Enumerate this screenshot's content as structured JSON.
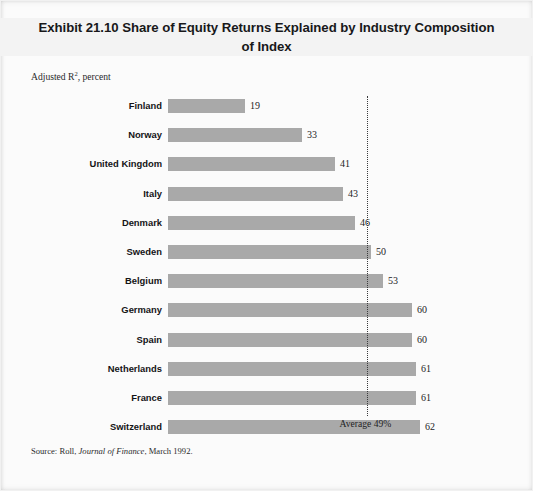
{
  "exhibit": {
    "title_line1": "Exhibit 21.10 Share of Equity Returns Explained by Industry Composition",
    "title_line2": "of Index",
    "axis_note": "Adjusted R",
    "axis_note_sup": "2",
    "axis_note_tail": ", percent",
    "source_prefix": "Source: Roll, ",
    "source_italic": "Journal of Finance",
    "source_suffix": ", March 1992.",
    "average_caption": "Average 49%"
  },
  "colors": {
    "bar": "#a9a9a9",
    "page_background": "#fbfbfb",
    "title_band": "#f3f3f3",
    "average_line": "#3a3a3c",
    "text": "#18181a"
  },
  "chart_data": {
    "type": "bar",
    "orientation": "horizontal",
    "title": "Exhibit 21.10 Share of Equity Returns Explained by Industry Composition of Index",
    "subtitle": "Adjusted R2, percent",
    "xlabel": "",
    "ylabel": "",
    "xlim": [
      0,
      70
    ],
    "grid": false,
    "legend": "none",
    "value_suffix": "",
    "categories": [
      "Finland",
      "Norway",
      "United Kingdom",
      "Italy",
      "Denmark",
      "Sweden",
      "Belgium",
      "Germany",
      "Spain",
      "Netherlands",
      "France",
      "Switzerland"
    ],
    "values": [
      19,
      33,
      41,
      43,
      46,
      50,
      53,
      60,
      60,
      61,
      61,
      62
    ],
    "annotations": [
      {
        "label": "Average 49%",
        "type": "reference-line",
        "value": 49
      }
    ],
    "source": "Source: Roll, Journal of Finance, March 1992."
  }
}
